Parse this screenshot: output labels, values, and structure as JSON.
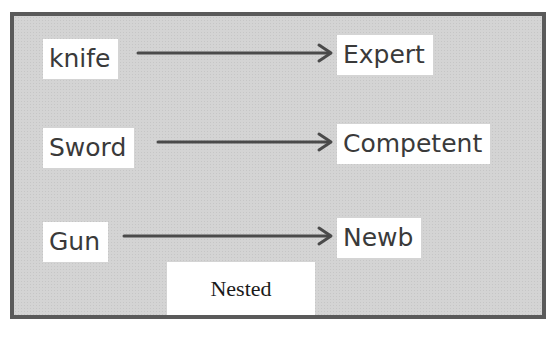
{
  "diagram": {
    "rows": [
      {
        "source": "knife",
        "target": "Expert"
      },
      {
        "source": "Sword",
        "target": "Competent"
      },
      {
        "source": "Gun",
        "target": "Newb"
      }
    ],
    "container_label": "Nested",
    "colors": {
      "background": "#d4d4d4",
      "border": "#5a5a5a",
      "arrow": "#4a4a4a",
      "label_bg": "#ffffff",
      "text": "#3a3a3a"
    }
  }
}
